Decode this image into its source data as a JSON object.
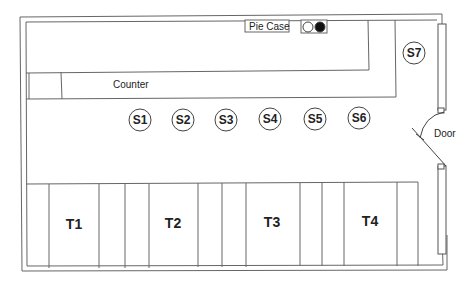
{
  "diagram": {
    "type": "floor-plan",
    "colors": {
      "line": "#555555",
      "fill": "#ffffff",
      "text": "#222222",
      "dark": "#111111"
    },
    "labels": {
      "pie_case": "Pie Case",
      "counter": "Counter",
      "door": "Door"
    },
    "stools": [
      {
        "id": "S1",
        "label": "S1"
      },
      {
        "id": "S2",
        "label": "S2"
      },
      {
        "id": "S3",
        "label": "S3"
      },
      {
        "id": "S4",
        "label": "S4"
      },
      {
        "id": "S5",
        "label": "S5"
      },
      {
        "id": "S6",
        "label": "S6"
      },
      {
        "id": "S7",
        "label": "S7"
      }
    ],
    "tables": [
      {
        "id": "T1",
        "label": "T1"
      },
      {
        "id": "T2",
        "label": "T2"
      },
      {
        "id": "T3",
        "label": "T3"
      },
      {
        "id": "T4",
        "label": "T4"
      }
    ]
  }
}
